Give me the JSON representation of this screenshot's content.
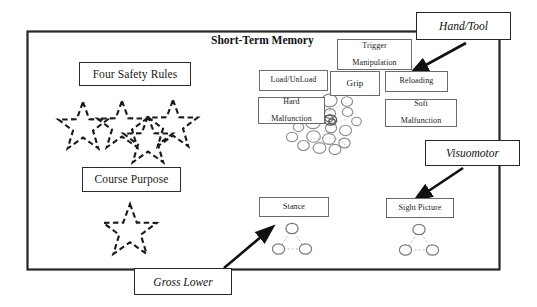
{
  "diagram": {
    "title": "Short-Term Memory",
    "frame": {
      "name": "short-term-memory-frame"
    },
    "left_column": {
      "boxes": [
        {
          "id": "four-safety-rules",
          "label": "Four Safety Rules"
        },
        {
          "id": "course-purpose",
          "label": "Course Purpose"
        }
      ],
      "star_group_top": {
        "name": "four-dashed-stars",
        "count": 4
      },
      "star_group_bottom": {
        "name": "single-dashed-star",
        "count": 1
      }
    },
    "skill_boxes": [
      {
        "id": "trigger-manipulation",
        "label": "Trigger\nManipulation",
        "line1": "Trigger",
        "line2": "Manipulation"
      },
      {
        "id": "load-unload",
        "label": "Load/UnLoad",
        "line1": "Load/UnLoad",
        "line2": ""
      },
      {
        "id": "grip",
        "label": "Grip",
        "line1": "Grip",
        "line2": ""
      },
      {
        "id": "reloading",
        "label": "Reloading",
        "line1": "Reloading",
        "line2": ""
      },
      {
        "id": "hard-malfunction",
        "label": "Hard Malfunction",
        "line1": "Hard",
        "line2": "Malfunction"
      },
      {
        "id": "soft-malfunction",
        "label": "Soft Malfunction",
        "line1": "Soft",
        "line2": "Malfunction"
      }
    ],
    "lower_boxes": [
      {
        "id": "stance",
        "label": "Stance"
      },
      {
        "id": "sight-picture",
        "label": "Sight Picture"
      }
    ],
    "outer_labels": [
      {
        "id": "hand-tool",
        "label": "Hand/Tool"
      },
      {
        "id": "visuomotor",
        "label": "Visuomotor"
      },
      {
        "id": "gross-lower",
        "label": "Gross Lower"
      }
    ],
    "clusters": [
      {
        "id": "hand-tool-cluster",
        "shape": "scattered-rings",
        "ring_count": 19
      },
      {
        "id": "stance-cluster",
        "shape": "triangle-rings",
        "ring_count": 3
      },
      {
        "id": "sight-picture-cluster",
        "shape": "triangle-rings",
        "ring_count": 3
      }
    ],
    "arrows": [
      {
        "id": "hand-tool-arrow",
        "from": "hand-tool",
        "to": "hand-tool-cluster"
      },
      {
        "id": "visuomotor-arrow",
        "from": "visuomotor",
        "to": "sight-picture-cluster"
      },
      {
        "id": "gross-lower-arrow",
        "from": "gross-lower",
        "to": "stance-cluster"
      }
    ],
    "colors": {
      "frame_stroke": "#262626",
      "box_stroke": "#6b6b6b",
      "ring_stroke": "#7a7a7a",
      "dash_stroke": "#1a1a1a",
      "arrow_fill": "#111111",
      "background": "#ffffff"
    }
  }
}
